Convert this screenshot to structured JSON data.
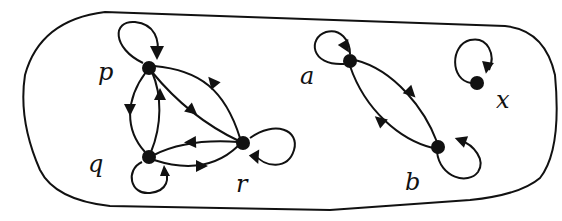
{
  "diagram": {
    "type": "directed-graph",
    "colors": {
      "ink": "#111111",
      "background": "#ffffff"
    },
    "nodes": [
      {
        "id": "p",
        "label": "p",
        "x": 149,
        "y": 68,
        "label_x": 98,
        "label_y": 78
      },
      {
        "id": "q",
        "label": "q",
        "x": 149,
        "y": 157,
        "label_x": 88,
        "label_y": 172
      },
      {
        "id": "r",
        "label": "r",
        "x": 243,
        "y": 143,
        "label_x": 236,
        "label_y": 192
      },
      {
        "id": "a",
        "label": "a",
        "x": 350,
        "y": 61,
        "label_x": 300,
        "label_y": 84
      },
      {
        "id": "b",
        "label": "b",
        "x": 438,
        "y": 147,
        "label_x": 405,
        "label_y": 190
      },
      {
        "id": "x",
        "label": "x",
        "x": 477,
        "y": 83,
        "label_x": 496,
        "label_y": 108
      }
    ],
    "edges": [
      {
        "from": "p",
        "to": "p",
        "kind": "self-loop"
      },
      {
        "from": "q",
        "to": "q",
        "kind": "self-loop"
      },
      {
        "from": "r",
        "to": "r",
        "kind": "self-loop"
      },
      {
        "from": "p",
        "to": "q",
        "kind": "curve"
      },
      {
        "from": "q",
        "to": "p",
        "kind": "curve"
      },
      {
        "from": "p",
        "to": "r",
        "kind": "straight"
      },
      {
        "from": "r",
        "to": "p",
        "kind": "curve"
      },
      {
        "from": "r",
        "to": "q",
        "kind": "curve"
      },
      {
        "from": "q",
        "to": "r",
        "kind": "curve"
      },
      {
        "from": "a",
        "to": "a",
        "kind": "self-loop"
      },
      {
        "from": "b",
        "to": "b",
        "kind": "self-loop"
      },
      {
        "from": "a",
        "to": "b",
        "kind": "curve"
      },
      {
        "from": "b",
        "to": "a",
        "kind": "curve"
      },
      {
        "from": "x",
        "to": "x",
        "kind": "self-loop"
      }
    ]
  }
}
